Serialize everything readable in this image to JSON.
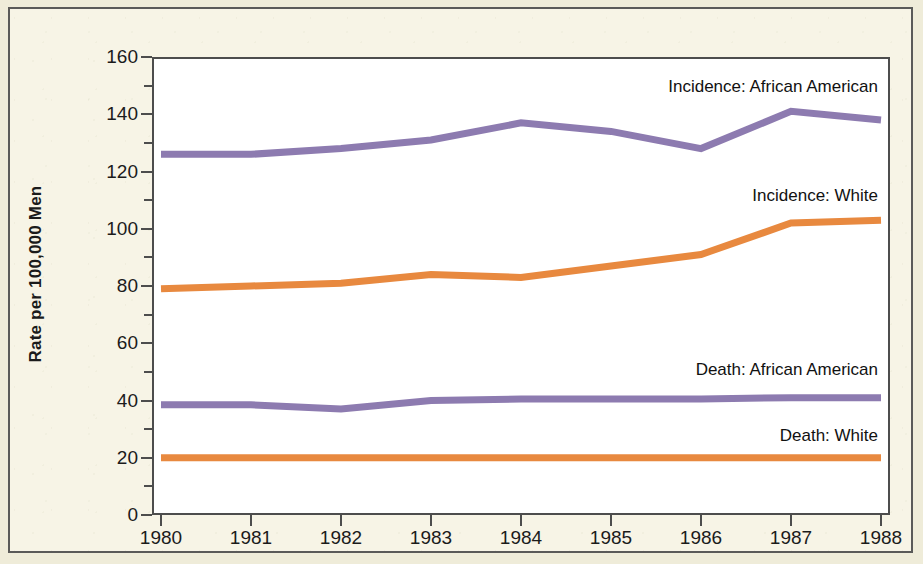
{
  "figure": {
    "background_color": "#f7f4e6",
    "border_color": "#5a5a58",
    "plot_background": "#ffffff"
  },
  "axes": {
    "y_title": "Rate per 100,000 Men",
    "y_ticks": [
      "0",
      "20",
      "40",
      "60",
      "80",
      "100",
      "120",
      "140",
      "160"
    ],
    "x_ticks": [
      "1980",
      "1981",
      "1982",
      "1983",
      "1984",
      "1985",
      "1986",
      "1987",
      "1988"
    ]
  },
  "annotations": {
    "incidence_african_american": "Incidence: African American",
    "incidence_white": "Incidence: White",
    "death_african_american": "Death: African American",
    "death_white": "Death: White"
  },
  "colors": {
    "purple": "#8d7bb0",
    "orange": "#e8893f",
    "axis": "#4d4d4d",
    "text": "#1b1b1b"
  },
  "chart_data": {
    "type": "line",
    "title": "",
    "xlabel": "",
    "ylabel": "Rate per 100,000 Men",
    "x": [
      1980,
      1981,
      1982,
      1983,
      1984,
      1985,
      1986,
      1987,
      1988
    ],
    "xlim": [
      1980,
      1988
    ],
    "ylim": [
      0,
      160
    ],
    "y_tick_interval": 20,
    "y_minor_tick_interval": 10,
    "grid": false,
    "legend": "inline-annotations",
    "series": [
      {
        "name": "Incidence: African American",
        "color": "#8d7bb0",
        "values": [
          126,
          126,
          128,
          131,
          137,
          134,
          128,
          141,
          138
        ]
      },
      {
        "name": "Incidence: White",
        "color": "#e8893f",
        "values": [
          79,
          80,
          81,
          84,
          83,
          87,
          91,
          102,
          103
        ]
      },
      {
        "name": "Death: African American",
        "color": "#8d7bb0",
        "values": [
          38.5,
          38.5,
          37,
          40,
          40.5,
          40.5,
          40.5,
          41,
          41
        ]
      },
      {
        "name": "Death: White",
        "color": "#e8893f",
        "values": [
          20,
          20,
          20,
          20,
          20,
          20,
          20,
          20,
          20
        ]
      }
    ]
  }
}
